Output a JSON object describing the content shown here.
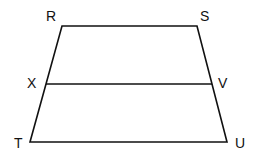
{
  "diagram": {
    "type": "trapezoid",
    "stroke_color": "#111111",
    "background": "#ffffff",
    "vertices": [
      {
        "label": "R",
        "x": 62,
        "y": 26,
        "lx": 46,
        "ly": 21
      },
      {
        "label": "S",
        "x": 197,
        "y": 26,
        "lx": 200,
        "ly": 21
      },
      {
        "label": "U",
        "x": 227,
        "y": 142,
        "lx": 235,
        "ly": 148
      },
      {
        "label": "T",
        "x": 30,
        "y": 142,
        "lx": 14,
        "ly": 148
      }
    ],
    "midsegment": {
      "from": {
        "label": "X",
        "x": 46,
        "y": 84,
        "lx": 27,
        "ly": 88
      },
      "to": {
        "label": "V",
        "x": 212,
        "y": 84,
        "lx": 218,
        "ly": 88
      }
    },
    "labels": {
      "R": "R",
      "S": "S",
      "T": "T",
      "U": "U",
      "X": "X",
      "V": "V"
    }
  }
}
